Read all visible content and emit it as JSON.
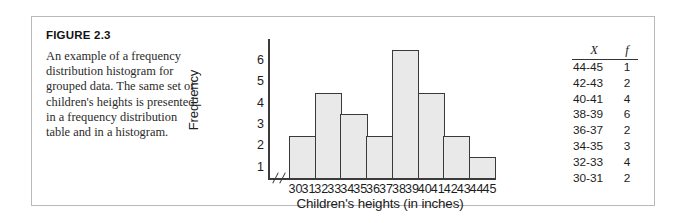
{
  "figure": {
    "label": "FIGURE 2.3",
    "caption": "An example of a frequency distribution histogram for grouped data. The same set of children's heights is presented in a frequency distribution table and in a histogram."
  },
  "chart_data": {
    "type": "bar",
    "title": "",
    "xlabel": "Children's heights (in inches)",
    "ylabel": "Frequency",
    "categories": [
      "30-31",
      "32-33",
      "34-35",
      "36-37",
      "38-39",
      "40-41",
      "42-43",
      "44-45"
    ],
    "values": [
      2,
      4,
      3,
      2,
      6,
      4,
      2,
      1
    ],
    "ylim": [
      0,
      6.6
    ],
    "yticks": [
      6,
      5,
      4,
      3,
      2,
      1
    ],
    "xticks": [
      "30",
      "31",
      "32",
      "33",
      "34",
      "35",
      "36",
      "37",
      "38",
      "39",
      "40",
      "41",
      "42",
      "43",
      "44",
      "45"
    ],
    "grid": false,
    "legend": "none",
    "axis_break": true,
    "bar_fill": "#e9e9e9",
    "bar_stroke": "#3a3a3a"
  },
  "frequency_table": {
    "headers": {
      "x": "X",
      "f": "f"
    },
    "rows": [
      {
        "x": "44-45",
        "f": "1"
      },
      {
        "x": "42-43",
        "f": "2"
      },
      {
        "x": "40-41",
        "f": "4"
      },
      {
        "x": "38-39",
        "f": "6"
      },
      {
        "x": "36-37",
        "f": "2"
      },
      {
        "x": "34-35",
        "f": "3"
      },
      {
        "x": "32-33",
        "f": "4"
      },
      {
        "x": "30-31",
        "f": "2"
      }
    ]
  }
}
